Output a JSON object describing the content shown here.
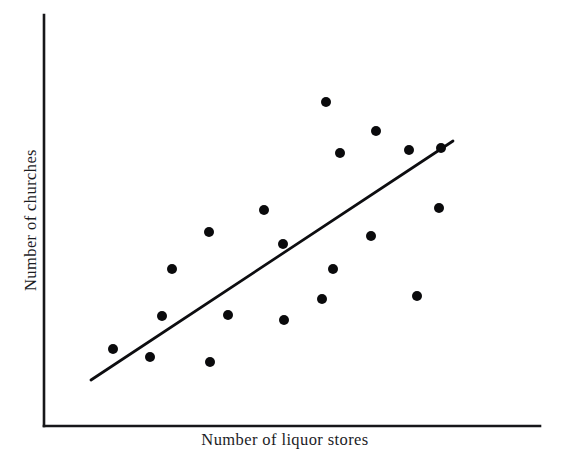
{
  "chart_data": {
    "type": "scatter",
    "title": "",
    "xlabel": "Number of liquor stores",
    "ylabel": "Number of churches",
    "grid": false,
    "legend": null,
    "axis_style": "open-L-frame (left and bottom spines only, no tick marks, no tick labels)",
    "marker": {
      "shape": "circle",
      "color": "#0a0a0c",
      "radius_px": 5
    },
    "axes_px": {
      "x_axis": {
        "x_start": 44,
        "x_end": 540,
        "y": 426
      },
      "y_axis": {
        "x": 44,
        "y_top": 15,
        "y_bottom": 426
      }
    },
    "xlim": [
      44,
      540
    ],
    "ylim": [
      426,
      15
    ],
    "n_points": 20,
    "points_px": [
      {
        "x": 113,
        "y": 349
      },
      {
        "x": 150,
        "y": 357
      },
      {
        "x": 162,
        "y": 316
      },
      {
        "x": 172,
        "y": 269
      },
      {
        "x": 209,
        "y": 232
      },
      {
        "x": 210,
        "y": 362
      },
      {
        "x": 228,
        "y": 315
      },
      {
        "x": 264,
        "y": 210
      },
      {
        "x": 283,
        "y": 244
      },
      {
        "x": 284,
        "y": 320
      },
      {
        "x": 322,
        "y": 299
      },
      {
        "x": 326,
        "y": 102
      },
      {
        "x": 333,
        "y": 269
      },
      {
        "x": 340,
        "y": 153
      },
      {
        "x": 371,
        "y": 236
      },
      {
        "x": 376,
        "y": 131
      },
      {
        "x": 409,
        "y": 150
      },
      {
        "x": 417,
        "y": 296
      },
      {
        "x": 439,
        "y": 208
      },
      {
        "x": 441,
        "y": 148
      }
    ],
    "trend_line": {
      "label": "line of best fit",
      "x1": 91,
      "y1": 380,
      "x2": 453,
      "y2": 141,
      "color": "#0d0d10",
      "width_px": 2.7
    },
    "annotations": []
  },
  "figure": {
    "background": "#ffffff",
    "width": 570,
    "height": 462
  }
}
